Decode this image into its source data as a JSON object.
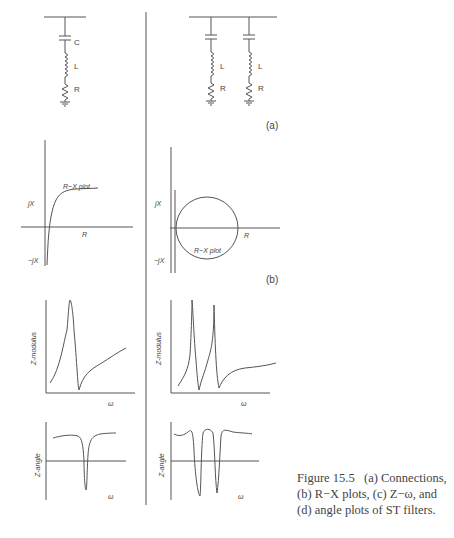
{
  "figure": {
    "caption": {
      "number": "Figure 15.5",
      "line1": "(a) Connections,",
      "line2": "(b) R−X plots, (c) Z−ω, and",
      "line3": "(d) angle plots of ST filters."
    },
    "panel_labels": {
      "a": "(a)",
      "b": "(b)"
    },
    "circuits": {
      "single": {
        "labels": [
          "C",
          "L",
          "R"
        ]
      },
      "double": {
        "labels": [
          "L",
          "R",
          "L",
          "R"
        ]
      }
    },
    "rx_plots": {
      "left": {
        "y_pos": "jX",
        "y_neg": "−jX",
        "x": "R",
        "curve_label": "R−X plot"
      },
      "right": {
        "y_pos": "jX",
        "y_neg": "−jX",
        "x": "R",
        "curve_label": "R−X plot"
      }
    },
    "z_modulus": {
      "left": {
        "ylabel": "Z-modulus",
        "xlabel": "ω"
      },
      "right": {
        "ylabel": "Z-modulus",
        "xlabel": "ω"
      }
    },
    "z_angle": {
      "left": {
        "ylabel": "Z-angle",
        "xlabel": "ω"
      },
      "right": {
        "ylabel": "Z-angle",
        "xlabel": "ω"
      }
    }
  },
  "colors": {
    "line": "#555555",
    "text": "#444444",
    "background": "#ffffff"
  }
}
